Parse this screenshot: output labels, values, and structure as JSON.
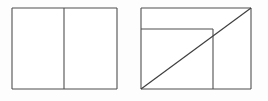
{
  "page": {
    "background_color": "#fdfdfd",
    "width": 268,
    "height": 101
  },
  "style": {
    "line_color": "#4f4f4f",
    "diagonal_color": "#3f3f3f",
    "fill_color": "#ffffff",
    "line_width": 1.1
  },
  "chart_data": {
    "type": "diagram",
    "title": "",
    "xlabel": "",
    "ylabel": "",
    "figures": [
      {
        "id": "figure-left",
        "name": "rectangle-split-vertically",
        "description": "Rectangle divided into two parts by one vertical line",
        "outline": {
          "x": 12,
          "y": 8,
          "width": 105,
          "height": 81
        },
        "segments": [
          {
            "name": "outline-top",
            "x1": 12,
            "y1": 8,
            "x2": 117,
            "y2": 8
          },
          {
            "name": "outline-right",
            "x1": 117,
            "y1": 8,
            "x2": 117,
            "y2": 89
          },
          {
            "name": "outline-bottom",
            "x1": 117,
            "y1": 89,
            "x2": 12,
            "y2": 89
          },
          {
            "name": "outline-left",
            "x1": 12,
            "y1": 89,
            "x2": 12,
            "y2": 8
          },
          {
            "name": "vertical-divider",
            "x1": 64,
            "y1": 8,
            "x2": 64,
            "y2": 89
          }
        ],
        "region_count": 2
      },
      {
        "id": "figure-right",
        "name": "rectangle-with-horizontal-vertical-and-diagonal",
        "description": "Rectangle with a horizontal line near the top, a vertical line on the right side, and a diagonal from the bottom-left corner to the top-right corner",
        "outline": {
          "x": 141,
          "y": 8,
          "width": 110,
          "height": 81
        },
        "segments": [
          {
            "name": "outline-top",
            "x1": 141,
            "y1": 8,
            "x2": 251,
            "y2": 8
          },
          {
            "name": "outline-right",
            "x1": 251,
            "y1": 8,
            "x2": 251,
            "y2": 89
          },
          {
            "name": "outline-bottom",
            "x1": 251,
            "y1": 89,
            "x2": 141,
            "y2": 89
          },
          {
            "name": "outline-left",
            "x1": 141,
            "y1": 89,
            "x2": 141,
            "y2": 8
          },
          {
            "name": "horizontal-line",
            "x1": 141,
            "y1": 29,
            "x2": 213,
            "y2": 29
          },
          {
            "name": "vertical-line",
            "x1": 213,
            "y1": 29,
            "x2": 213,
            "y2": 89
          },
          {
            "name": "diagonal-line",
            "x1": 141,
            "y1": 89,
            "x2": 251,
            "y2": 8
          }
        ],
        "region_count": 5
      }
    ]
  }
}
